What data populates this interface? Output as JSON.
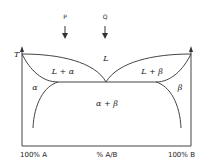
{
  "diagram": {
    "type": "binary eutectic phase diagram",
    "y_axis_label": "T",
    "x_axis": {
      "left_label": "100% A",
      "center_label": "% A/B",
      "right_label": "100% B"
    },
    "markers": [
      {
        "label": "P"
      },
      {
        "label": "Q"
      }
    ],
    "regions": {
      "liquid": "L",
      "liquid_alpha": "L + α",
      "liquid_beta": "L + β",
      "alpha": "α",
      "beta": "β",
      "alpha_beta": "α + β"
    },
    "colors": {
      "line": "#444444",
      "text": "#222222",
      "background": "#ffffff"
    }
  }
}
